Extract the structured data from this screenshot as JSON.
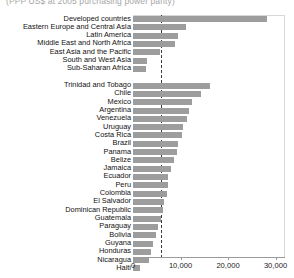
{
  "chart_data": {
    "type": "bar",
    "orientation": "horizontal",
    "title": "(PPP US$ at 2005 purchasing power parity)",
    "xlabel": "",
    "ylabel": "",
    "xlim": [
      0,
      32000
    ],
    "grid": false,
    "legend": false,
    "reference_line": {
      "value": 5800,
      "style": "dashed"
    },
    "ticks": [
      {
        "value": 0,
        "label": "0"
      },
      {
        "value": 10000,
        "label": "10,000"
      },
      {
        "value": 20000,
        "label": "20,000"
      },
      {
        "value": 30000,
        "label": "30,000"
      }
    ],
    "groups": [
      {
        "name": "regions",
        "categories": [
          "Developed countries",
          "Eastern Europe and Central AsIa",
          "Latin America",
          "Middle East and North Africa",
          "East Asia and the Pacific",
          "South and West Asia",
          "Sub-Saharan Africa"
        ],
        "values": [
          28200,
          11100,
          9400,
          8900,
          5600,
          3000,
          2800
        ]
      },
      {
        "name": "countries",
        "categories": [
          "Trinidad and Tobago",
          "Chile",
          "Mexico",
          "Argentina",
          "Venezuela",
          "Uruguay",
          "Costa Rica",
          "Brazil",
          "Panama",
          "Belize",
          "Jamaica",
          "Ecuador",
          "Peru",
          "Colombia",
          "El Salvador",
          "Dominican Republic",
          "Guatemala",
          "Paraguay",
          "Bolivia",
          "Guyana",
          "Honduras",
          "Nicaragua",
          "Haiti"
        ],
        "values": [
          16200,
          14300,
          12400,
          11800,
          11300,
          10500,
          10300,
          9500,
          9200,
          8600,
          7900,
          7400,
          7300,
          7200,
          6500,
          6300,
          5900,
          5300,
          4800,
          4200,
          3700,
          3300,
          1500
        ]
      }
    ]
  }
}
